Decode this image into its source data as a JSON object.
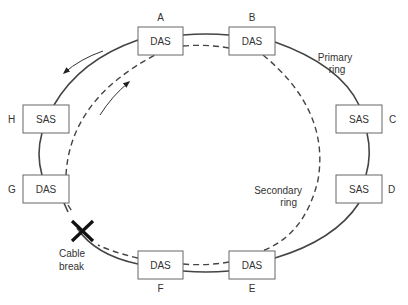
{
  "diagram": {
    "nodes": [
      {
        "id": "A",
        "type": "DAS"
      },
      {
        "id": "B",
        "type": "DAS"
      },
      {
        "id": "C",
        "type": "SAS"
      },
      {
        "id": "D",
        "type": "SAS"
      },
      {
        "id": "E",
        "type": "DAS"
      },
      {
        "id": "F",
        "type": "DAS"
      },
      {
        "id": "G",
        "type": "DAS"
      },
      {
        "id": "H",
        "type": "SAS"
      }
    ],
    "labels": {
      "primary_ring": [
        "Primary",
        "ring"
      ],
      "secondary_ring": [
        "Secondary",
        "ring"
      ],
      "cable_break": [
        "Cable",
        "break"
      ]
    },
    "colors": {
      "line": "#333333",
      "box_border": "#666666",
      "break_mark": "#111111"
    }
  }
}
